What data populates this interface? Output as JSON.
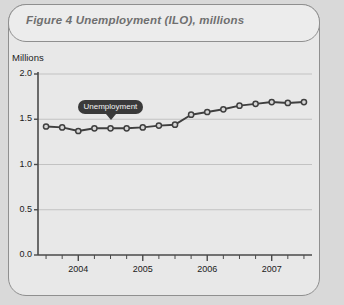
{
  "figure": {
    "title": "Figure 4  Unemployment (ILO), millions"
  },
  "chart_data": {
    "type": "line",
    "title": "Figure 4  Unemployment (ILO), millions",
    "ylabel": "Millions",
    "xlabel": "",
    "ylim": [
      0.0,
      2.0
    ],
    "yticks": [
      "0.0",
      "0.5",
      "1.0",
      "1.5",
      "2.0"
    ],
    "ytick_values": [
      0.0,
      0.5,
      1.0,
      1.5,
      2.0
    ],
    "xticks": [
      "2004",
      "2005",
      "2006",
      "2007"
    ],
    "xtick_values": [
      2004,
      2005,
      2006,
      2007
    ],
    "grid": "horizontal",
    "legend_position": "inline-callout",
    "annotations": [
      {
        "text": "Unemployment",
        "x": 2004.5,
        "y": 1.42,
        "style": "dark-rounded-badge"
      }
    ],
    "series": [
      {
        "name": "Unemployment",
        "color": "#3f3f3f",
        "marker": "circle",
        "x": [
          2003.5,
          2003.75,
          2004.0,
          2004.25,
          2004.5,
          2004.75,
          2005.0,
          2005.25,
          2005.5,
          2005.75,
          2006.0,
          2006.25,
          2006.5,
          2006.75,
          2007.0,
          2007.25,
          2007.5
        ],
        "values": [
          1.42,
          1.41,
          1.37,
          1.4,
          1.4,
          1.4,
          1.41,
          1.43,
          1.44,
          1.55,
          1.58,
          1.61,
          1.65,
          1.67,
          1.69,
          1.68,
          1.69
        ]
      }
    ]
  }
}
